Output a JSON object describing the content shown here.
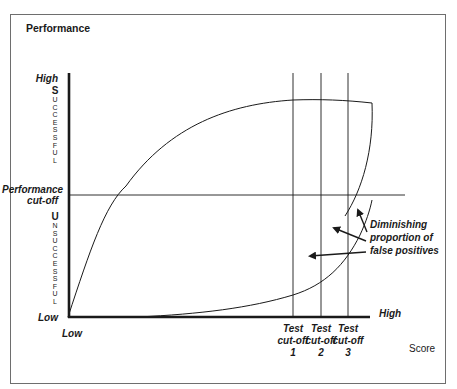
{
  "diagram": {
    "title": "Performance",
    "y_axis": {
      "high_label": "High",
      "low_label": "Low",
      "cutoff_label_line1": "Performance",
      "cutoff_label_line2": "cut-off",
      "upper_region_letters": [
        "S",
        "U",
        "C",
        "C",
        "E",
        "S",
        "S",
        "F",
        "U",
        "L"
      ],
      "lower_region_letters": [
        "U",
        "N",
        "S",
        "U",
        "C",
        "C",
        "E",
        "S",
        "S",
        "F",
        "U",
        "L"
      ]
    },
    "x_axis": {
      "low_label": "Low",
      "high_label": "High",
      "axis_label": "Score"
    },
    "test_cutoffs": [
      {
        "line1": "Test",
        "line2": "cut-off",
        "number": "1"
      },
      {
        "line1": "Test",
        "line2": "cut-off",
        "number": "2"
      },
      {
        "line1": "Test",
        "line2": "cut-off",
        "number": "3"
      }
    ],
    "annotation": {
      "line1": "Diminishing",
      "line2": "proportion of",
      "line3": "false positives"
    },
    "colors": {
      "ink": "#1a1a1a",
      "frame": "#6e6e6e",
      "background": "#ffffff"
    }
  }
}
